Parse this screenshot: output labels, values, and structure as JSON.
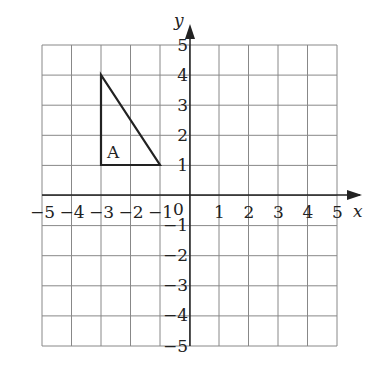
{
  "chart_data": {
    "type": "coordinate-grid",
    "title": "",
    "xlabel": "x",
    "ylabel": "y",
    "xlim": [
      -5,
      5
    ],
    "ylim": [
      -5,
      5
    ],
    "grid": true,
    "x_ticks": [
      "-5",
      "-4",
      "-3",
      "-2",
      "-1",
      "1",
      "2",
      "3",
      "4",
      "5"
    ],
    "y_ticks": [
      "5",
      "4",
      "3",
      "2",
      "1",
      "-1",
      "-2",
      "-3",
      "-4",
      "-5"
    ],
    "origin_label": "0",
    "shapes": [
      {
        "name": "A",
        "type": "triangle",
        "vertices": [
          [
            -3,
            4
          ],
          [
            -3,
            1
          ],
          [
            -1,
            1
          ]
        ]
      }
    ]
  },
  "labels": {
    "x_axis": "x",
    "y_axis": "y",
    "origin": "0",
    "shape_label": "A"
  }
}
